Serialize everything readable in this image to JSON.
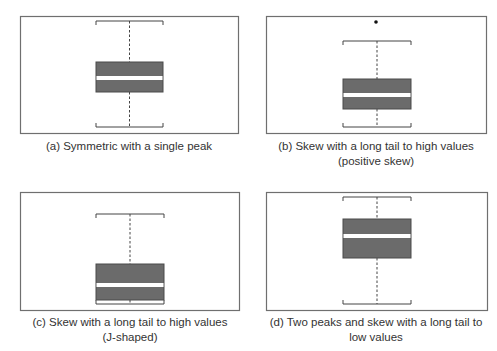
{
  "figure": {
    "panels": [
      {
        "id": "a",
        "caption_line1": "(a) Symmetric with a single peak",
        "caption_line2": "",
        "frame": {
          "x": 20,
          "y": 16,
          "w": 218,
          "h": 117
        },
        "box": {
          "x": 96,
          "w": 67,
          "whisker_top": 21,
          "q3": 62,
          "median": 78,
          "q1": 92,
          "whisker_bottom": 127
        },
        "outliers": []
      },
      {
        "id": "b",
        "caption_line1": "(b) Skew with a long tail to high values",
        "caption_line2": "(positive skew)",
        "frame": {
          "x": 266,
          "y": 16,
          "w": 220,
          "h": 117
        },
        "box": {
          "x": 343,
          "w": 68,
          "whisker_top": 41,
          "q3": 79,
          "median": 95,
          "q1": 109,
          "whisker_bottom": 127
        },
        "outliers": [
          {
            "x": 376,
            "y": 22
          }
        ]
      },
      {
        "id": "c",
        "caption_line1": "(c) Skew with a long tail to high values",
        "caption_line2": "(J-shaped)",
        "frame": {
          "x": 20,
          "y": 192,
          "w": 219,
          "h": 118
        },
        "box": {
          "x": 96,
          "w": 68,
          "whisker_top": 214,
          "q3": 264,
          "median": 285,
          "q1": 300,
          "whisker_bottom": 304
        },
        "outliers": []
      },
      {
        "id": "d",
        "caption_line1": "(d) Two peaks and skew with a long tail to",
        "caption_line2": "low values",
        "frame": {
          "x": 266,
          "y": 192,
          "w": 221,
          "h": 118
        },
        "box": {
          "x": 343,
          "w": 68,
          "whisker_top": 197,
          "q3": 219,
          "median": 236,
          "q1": 258,
          "whisker_bottom": 304
        },
        "outliers": []
      }
    ],
    "colors": {
      "frame": "#6f6f6f",
      "box_fill": "#6b6b6b",
      "box_stroke": "#4a4a4a",
      "median_band": "#ffffff",
      "whisker": "#444444",
      "outlier": "#111111",
      "caption": "#333333"
    }
  }
}
